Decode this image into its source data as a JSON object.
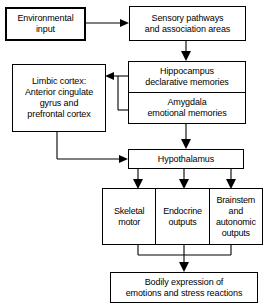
{
  "diagram": {
    "background_color": "#ffffff",
    "line_color": "#000000",
    "text_color": "#000000",
    "nodes": {
      "environmental_input": "Environmental\ninput",
      "sensory_pathways": "Sensory pathways\nand association areas",
      "limbic_cortex": "Limbic cortex:\nAnterior cingulate\ngyrus and\nprefrontal cortex",
      "hippocampus": "Hippocampus\ndeclarative memories",
      "amygdala": "Amygdala\nemotional memories",
      "hypothalamus": "Hypothalamus",
      "skeletal_motor": "Skeletal\nmotor",
      "endocrine_outputs": "Endocrine\noutputs",
      "brainstem_autonomic": "Brainstem\nand\nautonomic\noutputs",
      "bodily_expression": "Bodily expression of\nemotions and stress reactions"
    },
    "edges": [
      {
        "name": "environmental-input-to-sensory-pathways",
        "from": "environmental_input",
        "to": "sensory_pathways"
      },
      {
        "name": "sensory-pathways-to-hippocampus",
        "from": "sensory_pathways",
        "to": "hippocampus"
      },
      {
        "name": "hippocampus-to-limbic-cortex",
        "from": "hippocampus",
        "to": "limbic_cortex"
      },
      {
        "name": "amygdala-to-limbic-cortex",
        "from": "amygdala",
        "to": "limbic_cortex"
      },
      {
        "name": "amygdala-to-hypothalamus",
        "from": "amygdala",
        "to": "hypothalamus"
      },
      {
        "name": "limbic-cortex-to-hypothalamus",
        "from": "limbic_cortex",
        "to": "hypothalamus"
      },
      {
        "name": "hypothalamus-to-skeletal-motor",
        "from": "hypothalamus",
        "to": "skeletal_motor"
      },
      {
        "name": "hypothalamus-to-endocrine-outputs",
        "from": "hypothalamus",
        "to": "endocrine_outputs"
      },
      {
        "name": "hypothalamus-to-brainstem-autonomic",
        "from": "hypothalamus",
        "to": "brainstem_autonomic"
      },
      {
        "name": "outputs-to-bodily-expression",
        "from": "outputs_group",
        "to": "bodily_expression"
      }
    ]
  }
}
